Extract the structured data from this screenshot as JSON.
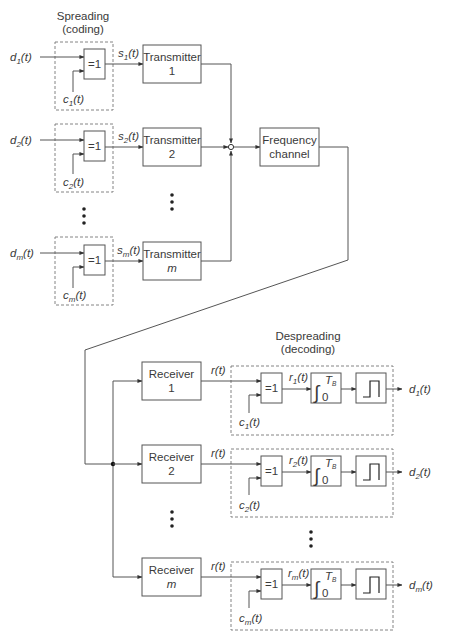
{
  "spreading": {
    "title_line1": "Spreading",
    "title_line2": "(coding)",
    "rows": [
      {
        "input": "d",
        "input_sub": "1",
        "code": "c",
        "code_sub": "1",
        "signal": "s",
        "signal_sub": "1",
        "xor_label": "=1",
        "tx_line1": "Transmitter",
        "tx_line2": "1",
        "tx_line2_italic": false
      },
      {
        "input": "d",
        "input_sub": "2",
        "code": "c",
        "code_sub": "2",
        "signal": "s",
        "signal_sub": "2",
        "xor_label": "=1",
        "tx_line1": "Transmitter",
        "tx_line2": "2",
        "tx_line2_italic": false
      },
      {
        "input": "d",
        "input_sub": "m",
        "code": "c",
        "code_sub": "m",
        "signal": "s",
        "signal_sub": "m",
        "xor_label": "=1",
        "tx_line1": "Transmitter",
        "tx_line2": "m",
        "tx_line2_italic": true
      }
    ]
  },
  "channel": {
    "line1": "Frequency",
    "line2": "channel"
  },
  "despreading": {
    "title_line1": "Despreading",
    "title_line2": "(decoding)",
    "rows": [
      {
        "rx_line1": "Receiver",
        "rx_line2": "1",
        "rx_line2_italic": false,
        "rx_out": "r(t)",
        "xor_label": "=1",
        "code": "c",
        "code_sub": "1",
        "mid": "r",
        "mid_sub": "1",
        "integral_upper": "T",
        "integral_upper_sub": "B",
        "integral_lower": "0",
        "output": "d",
        "output_sub": "1"
      },
      {
        "rx_line1": "Receiver",
        "rx_line2": "2",
        "rx_line2_italic": false,
        "rx_out": "r(t)",
        "xor_label": "=1",
        "code": "c",
        "code_sub": "2",
        "mid": "r",
        "mid_sub": "2",
        "integral_upper": "T",
        "integral_upper_sub": "B",
        "integral_lower": "0",
        "output": "d",
        "output_sub": "2"
      },
      {
        "rx_line1": "Receiver",
        "rx_line2": "m",
        "rx_line2_italic": true,
        "rx_out": "r(t)",
        "xor_label": "=1",
        "code": "c",
        "code_sub": "m",
        "mid": "r",
        "mid_sub": "m",
        "integral_upper": "T",
        "integral_upper_sub": "B",
        "integral_lower": "0",
        "output": "d",
        "output_sub": "m"
      }
    ]
  },
  "time_arg": "(t)",
  "colors": {
    "line": "#555555",
    "text": "#3a3a3a",
    "dashed": "#777777",
    "background": "#ffffff"
  }
}
